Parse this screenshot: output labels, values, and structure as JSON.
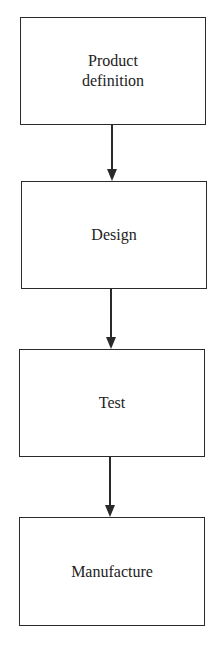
{
  "diagram": {
    "type": "flowchart",
    "direction": "top-to-bottom",
    "nodes": [
      {
        "id": "product-definition",
        "label": "Product\ndefinition"
      },
      {
        "id": "design",
        "label": "Design"
      },
      {
        "id": "test",
        "label": "Test"
      },
      {
        "id": "manufacture",
        "label": "Manufacture"
      }
    ],
    "edges": [
      {
        "from": "product-definition",
        "to": "design"
      },
      {
        "from": "design",
        "to": "test"
      },
      {
        "from": "test",
        "to": "manufacture"
      }
    ]
  }
}
